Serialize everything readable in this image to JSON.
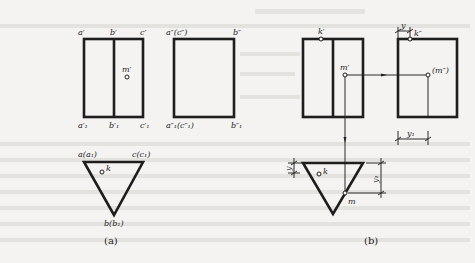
{
  "figure_a": {
    "caption": "(a)",
    "front_view": {
      "labels_top": [
        "a′",
        "b′",
        "c′"
      ],
      "labels_bottom": [
        "a′₁",
        "b′₁",
        "c′₁"
      ],
      "point": "m′"
    },
    "side_view": {
      "labels_top": [
        "a″(c″)",
        "b″"
      ],
      "labels_bottom": [
        "a″₁(c″₁)",
        "b″₁"
      ]
    },
    "top_view": {
      "label_left": "a(a₁)",
      "label_right": "c(c₁)",
      "label_bottom": "b(b₁)",
      "point": "k"
    }
  },
  "figure_b": {
    "caption": "(b)",
    "front_view": {
      "point_k": "k′",
      "point_m": "m′"
    },
    "side_view": {
      "point_k": "k″",
      "point_m": "(m″)",
      "dim_top": "y",
      "dim_bottom": "y₁"
    },
    "top_view": {
      "point_k": "k",
      "point_m": "m",
      "dim_left": "y",
      "dim_right": "y₁"
    }
  },
  "colors": {
    "line": "#1e1e1e",
    "background": "#f4f3f1"
  }
}
